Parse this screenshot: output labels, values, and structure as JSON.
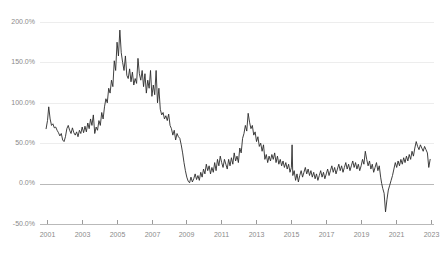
{
  "chart_data": {
    "type": "line",
    "title": "",
    "subtitle": "",
    "xlabel": "",
    "ylabel": "",
    "xlim": [
      2000.6,
      2023.2
    ],
    "ylim": [
      -50,
      200
    ],
    "grid": true,
    "legend": null,
    "legend_position": "none",
    "y_ticks": [
      -50,
      0,
      50,
      100,
      150,
      200
    ],
    "y_tick_labels": [
      "-50.0%",
      "0.0%",
      "50.0%",
      "100.0%",
      "150.0%",
      "200.0%"
    ],
    "x_ticks": [
      2001,
      2003,
      2005,
      2007,
      2009,
      2011,
      2013,
      2015,
      2017,
      2019,
      2021,
      2023
    ],
    "x_tick_labels": [
      "2001",
      "2003",
      "2005",
      "2007",
      "2009",
      "2011",
      "2013",
      "2015",
      "2017",
      "2019",
      "2021",
      "2023"
    ],
    "series": [
      {
        "name": "",
        "color": "#2b2b2b",
        "x": [
          2000.95,
          2001.03,
          2001.1,
          2001.18,
          2001.26,
          2001.34,
          2001.42,
          2001.5,
          2001.58,
          2001.66,
          2001.74,
          2001.82,
          2001.9,
          2001.98,
          2002.06,
          2002.14,
          2002.22,
          2002.3,
          2002.38,
          2002.46,
          2002.54,
          2002.62,
          2002.7,
          2002.78,
          2002.86,
          2002.94,
          2003.02,
          2003.1,
          2003.18,
          2003.26,
          2003.34,
          2003.42,
          2003.5,
          2003.58,
          2003.66,
          2003.74,
          2003.82,
          2003.9,
          2003.98,
          2004.06,
          2004.14,
          2004.22,
          2004.3,
          2004.38,
          2004.46,
          2004.54,
          2004.62,
          2004.7,
          2004.78,
          2004.86,
          2004.94,
          2005.02,
          2005.1,
          2005.18,
          2005.26,
          2005.34,
          2005.42,
          2005.5,
          2005.58,
          2005.66,
          2005.74,
          2005.82,
          2005.9,
          2005.98,
          2006.06,
          2006.14,
          2006.22,
          2006.3,
          2006.38,
          2006.46,
          2006.54,
          2006.62,
          2006.7,
          2006.78,
          2006.86,
          2006.94,
          2007.02,
          2007.1,
          2007.18,
          2007.26,
          2007.34,
          2007.42,
          2007.5,
          2007.58,
          2007.66,
          2007.74,
          2007.82,
          2007.9,
          2007.98,
          2008.06,
          2008.14,
          2008.22,
          2008.3,
          2008.38,
          2008.46,
          2008.54,
          2008.62,
          2008.7,
          2008.78,
          2008.86,
          2008.94,
          2009.02,
          2009.1,
          2009.18,
          2009.26,
          2009.34,
          2009.42,
          2009.5,
          2009.58,
          2009.66,
          2009.74,
          2009.82,
          2009.9,
          2009.98,
          2010.06,
          2010.14,
          2010.22,
          2010.3,
          2010.38,
          2010.46,
          2010.54,
          2010.62,
          2010.7,
          2010.78,
          2010.86,
          2010.94,
          2011.02,
          2011.1,
          2011.18,
          2011.26,
          2011.34,
          2011.42,
          2011.5,
          2011.58,
          2011.66,
          2011.74,
          2011.82,
          2011.9,
          2011.98,
          2012.06,
          2012.14,
          2012.22,
          2012.3,
          2012.38,
          2012.46,
          2012.54,
          2012.62,
          2012.7,
          2012.78,
          2012.86,
          2012.94,
          2013.02,
          2013.1,
          2013.18,
          2013.26,
          2013.34,
          2013.42,
          2013.5,
          2013.58,
          2013.66,
          2013.74,
          2013.82,
          2013.9,
          2013.98,
          2014.06,
          2014.14,
          2014.22,
          2014.3,
          2014.38,
          2014.46,
          2014.54,
          2014.62,
          2014.7,
          2014.78,
          2014.86,
          2014.94,
          2015.02,
          2015.06,
          2015.1,
          2015.18,
          2015.26,
          2015.34,
          2015.42,
          2015.5,
          2015.58,
          2015.66,
          2015.74,
          2015.82,
          2015.9,
          2015.98,
          2016.06,
          2016.14,
          2016.22,
          2016.3,
          2016.38,
          2016.46,
          2016.54,
          2016.62,
          2016.7,
          2016.78,
          2016.86,
          2016.94,
          2017.02,
          2017.1,
          2017.18,
          2017.26,
          2017.34,
          2017.42,
          2017.5,
          2017.58,
          2017.66,
          2017.74,
          2017.82,
          2017.9,
          2017.98,
          2018.06,
          2018.14,
          2018.22,
          2018.3,
          2018.38,
          2018.46,
          2018.54,
          2018.62,
          2018.7,
          2018.78,
          2018.86,
          2018.94,
          2019.02,
          2019.1,
          2019.18,
          2019.26,
          2019.34,
          2019.42,
          2019.5,
          2019.58,
          2019.66,
          2019.74,
          2019.82,
          2019.9,
          2019.98,
          2020.06,
          2020.14,
          2020.2,
          2020.26,
          2020.34,
          2020.42,
          2020.5,
          2020.58,
          2020.66,
          2020.74,
          2020.82,
          2020.9,
          2020.98,
          2021.06,
          2021.14,
          2021.22,
          2021.3,
          2021.38,
          2021.46,
          2021.54,
          2021.62,
          2021.7,
          2021.78,
          2021.86,
          2021.94,
          2022.02,
          2022.1,
          2022.18,
          2022.26,
          2022.34,
          2022.42,
          2022.5,
          2022.58,
          2022.66,
          2022.74,
          2022.82,
          2022.9,
          2022.98
        ],
        "values": [
          68,
          78,
          95,
          80,
          72,
          74,
          69,
          70,
          66,
          63,
          59,
          62,
          54,
          52,
          58,
          68,
          72,
          66,
          62,
          69,
          63,
          60,
          64,
          58,
          66,
          62,
          70,
          63,
          71,
          64,
          75,
          68,
          80,
          72,
          85,
          62,
          70,
          66,
          78,
          72,
          88,
          80,
          95,
          105,
          100,
          118,
          112,
          128,
          120,
          152,
          140,
          175,
          158,
          190,
          162,
          150,
          140,
          158,
          134,
          130,
          142,
          126,
          138,
          122,
          130,
          124,
          155,
          136,
          128,
          140,
          120,
          136,
          112,
          128,
          118,
          140,
          108,
          122,
          110,
          140,
          100,
          118,
          92,
          85,
          88,
          80,
          84,
          78,
          86,
          72,
          68,
          60,
          66,
          54,
          62,
          58,
          56,
          48,
          38,
          26,
          16,
          8,
          3,
          1,
          8,
          2,
          6,
          12,
          5,
          10,
          4,
          14,
          8,
          18,
          12,
          24,
          16,
          22,
          12,
          20,
          14,
          26,
          16,
          30,
          22,
          34,
          26,
          20,
          30,
          24,
          18,
          30,
          22,
          32,
          24,
          38,
          28,
          34,
          26,
          44,
          38,
          56,
          62,
          72,
          65,
          87,
          76,
          68,
          72,
          60,
          64,
          52,
          58,
          46,
          50,
          40,
          48,
          30,
          36,
          26,
          34,
          28,
          36,
          30,
          38,
          26,
          34,
          24,
          30,
          22,
          28,
          20,
          26,
          18,
          24,
          14,
          20,
          48,
          10,
          16,
          4,
          12,
          2,
          10,
          16,
          8,
          14,
          20,
          12,
          18,
          10,
          16,
          8,
          14,
          6,
          12,
          4,
          10,
          16,
          8,
          14,
          6,
          12,
          18,
          10,
          16,
          22,
          14,
          20,
          12,
          18,
          24,
          16,
          22,
          14,
          20,
          26,
          18,
          24,
          16,
          22,
          28,
          20,
          26,
          18,
          24,
          16,
          22,
          30,
          24,
          40,
          30,
          22,
          28,
          18,
          24,
          14,
          20,
          26,
          16,
          22,
          8,
          0,
          -6,
          -12,
          -35,
          -20,
          -8,
          -2,
          4,
          10,
          18,
          26,
          20,
          28,
          22,
          30,
          24,
          32,
          26,
          34,
          28,
          36,
          30,
          40,
          34,
          44,
          52,
          46,
          42,
          48,
          44,
          40,
          46,
          42,
          38,
          20,
          30
        ]
      }
    ]
  },
  "axes": {
    "y_axis_name": "percent-change-axis",
    "x_axis_name": "year-axis"
  }
}
